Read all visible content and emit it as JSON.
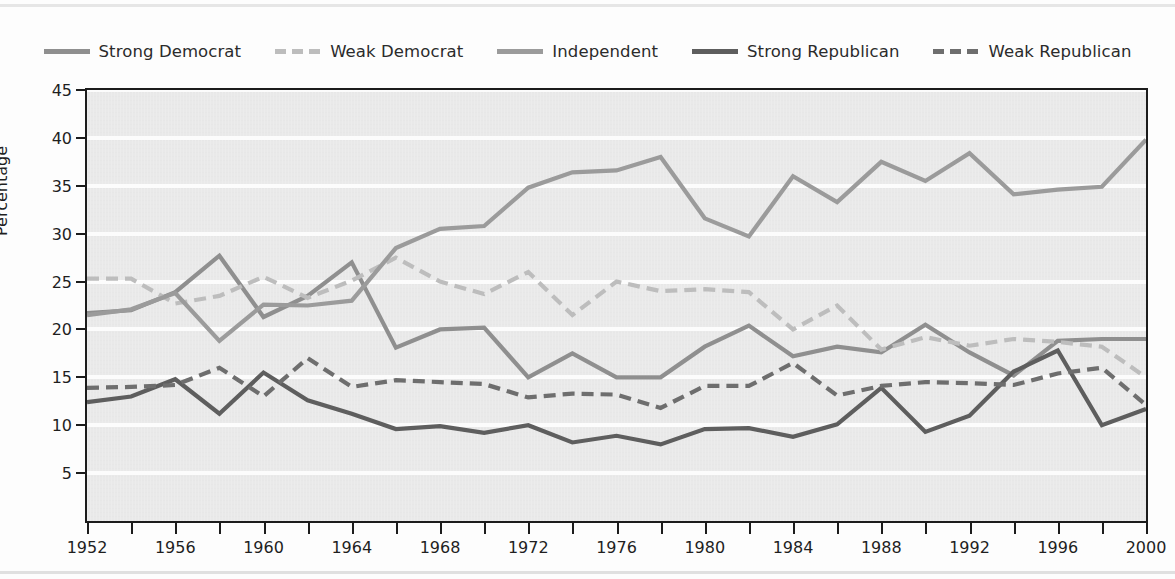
{
  "figure": {
    "background": "#fdfdfd",
    "plot_background": "#e9e9e9",
    "gridline_color": "#fcfcfc",
    "axis_color": "#1c1c1c"
  },
  "axis": {
    "ylabel": "Percentage",
    "y_ticks": [
      5,
      10,
      15,
      20,
      25,
      30,
      35,
      40,
      45
    ],
    "ylim": [
      0,
      45
    ],
    "x_tick_labels": [
      1952,
      1956,
      1960,
      1964,
      1968,
      1972,
      1976,
      1980,
      1984,
      1988,
      1992,
      1996,
      2000
    ],
    "x_minor_ticks": [
      1952,
      1954,
      1956,
      1958,
      1960,
      1962,
      1964,
      1966,
      1968,
      1970,
      1972,
      1974,
      1976,
      1978,
      1980,
      1982,
      1984,
      1986,
      1988,
      1990,
      1992,
      1994,
      1996,
      1998,
      2000
    ],
    "xlim": [
      1952,
      2000
    ],
    "xlabel": ""
  },
  "legend": {
    "position": "top-center",
    "items": [
      {
        "label": "Strong Democrat",
        "color": "#8f8f8f",
        "style": "solid"
      },
      {
        "label": "Weak Democrat",
        "color": "#bdbdbd",
        "style": "dashed"
      },
      {
        "label": "Independent",
        "color": "#9b9b9b",
        "style": "solid"
      },
      {
        "label": "Strong Republican",
        "color": "#5e5e5e",
        "style": "solid"
      },
      {
        "label": "Weak Republican",
        "color": "#6e6e6e",
        "style": "dashed"
      }
    ]
  },
  "chart_data": {
    "type": "line",
    "title": "",
    "xlabel": "",
    "ylabel": "Percentage",
    "xlim": [
      1952,
      2000
    ],
    "ylim": [
      0,
      45
    ],
    "grid": true,
    "legend_position": "top-center",
    "x": [
      1952,
      1954,
      1956,
      1958,
      1960,
      1962,
      1964,
      1966,
      1968,
      1970,
      1972,
      1974,
      1976,
      1978,
      1980,
      1982,
      1984,
      1986,
      1988,
      1990,
      1992,
      1994,
      1996,
      1998,
      2000
    ],
    "series": [
      {
        "name": "Strong Democrat",
        "color": "#8f8f8f",
        "style": "solid",
        "values": [
          21.7,
          22.0,
          23.9,
          27.7,
          21.3,
          23.5,
          27.0,
          18.1,
          20.0,
          20.2,
          15.0,
          17.5,
          15.0,
          15.0,
          18.2,
          20.4,
          17.2,
          18.2,
          17.6,
          20.5,
          17.6,
          15.2,
          18.8,
          19.0,
          19.0
        ]
      },
      {
        "name": "Weak Democrat",
        "color": "#bdbdbd",
        "style": "dashed",
        "values": [
          25.3,
          25.3,
          22.7,
          23.5,
          25.5,
          23.3,
          25.1,
          27.5,
          25.0,
          23.7,
          26.0,
          21.5,
          25.0,
          24.0,
          24.2,
          23.9,
          20.0,
          22.5,
          17.9,
          19.2,
          18.3,
          19.0,
          18.7,
          18.2,
          15.0
        ]
      },
      {
        "name": "Independent",
        "color": "#9b9b9b",
        "style": "solid",
        "values": [
          21.5,
          22.1,
          23.8,
          18.8,
          22.6,
          22.5,
          23.0,
          28.5,
          30.5,
          30.8,
          34.8,
          36.4,
          36.6,
          38.0,
          31.6,
          29.7,
          36.0,
          33.3,
          37.5,
          35.5,
          38.4,
          34.1,
          34.6,
          34.9,
          39.8
        ]
      },
      {
        "name": "Strong Republican",
        "color": "#5e5e5e",
        "style": "solid",
        "values": [
          12.4,
          13.0,
          14.8,
          11.2,
          15.5,
          12.6,
          11.2,
          9.6,
          9.9,
          9.2,
          10.0,
          8.2,
          8.9,
          8.0,
          9.6,
          9.7,
          8.8,
          10.1,
          13.9,
          9.3,
          11.0,
          15.6,
          17.8,
          10.0,
          11.7
        ]
      },
      {
        "name": "Weak Republican",
        "color": "#6e6e6e",
        "style": "dashed",
        "values": [
          13.9,
          14.0,
          14.2,
          16.0,
          13.0,
          17.0,
          14.0,
          14.7,
          14.5,
          14.3,
          12.9,
          13.3,
          13.2,
          11.8,
          14.1,
          14.1,
          16.5,
          13.1,
          14.1,
          14.5,
          14.4,
          14.2,
          15.4,
          16.0,
          12.1
        ]
      }
    ]
  }
}
